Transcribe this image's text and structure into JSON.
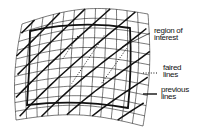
{
  "diagram": {
    "type": "warped-surface-grid",
    "labels": {
      "region": [
        "region of",
        "interest"
      ],
      "faired": [
        "faired",
        "lines"
      ],
      "previous": [
        "previous",
        "lines"
      ]
    },
    "legend": [
      {
        "label": "faired lines",
        "style": "dotted"
      },
      {
        "label": "previous lines",
        "style": "solid"
      }
    ],
    "colors": {
      "line": "#111111",
      "background": "#ffffff"
    }
  }
}
